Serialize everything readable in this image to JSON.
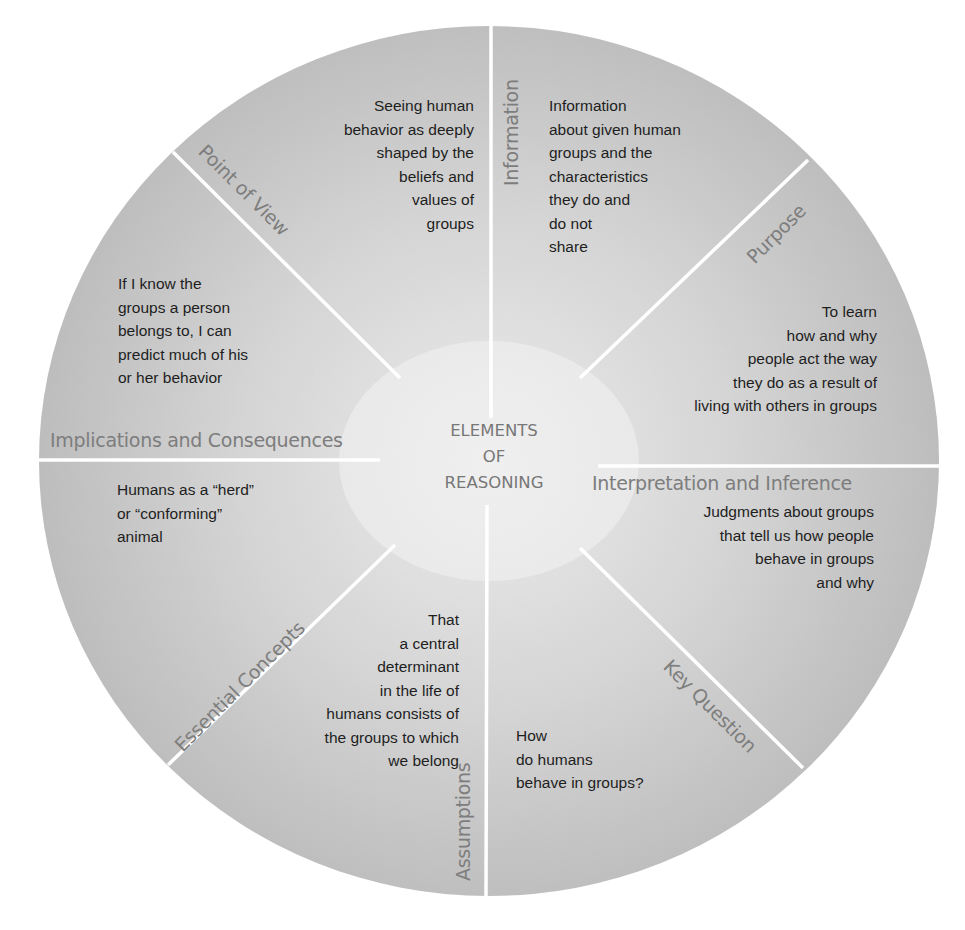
{
  "diagram": {
    "type": "segmented-wheel",
    "center_title": {
      "line1": "ELEMENTS",
      "line2": "OF",
      "line3": "REASONING"
    },
    "colors": {
      "segment_fill": "#c8c8c8",
      "segment_fill_light": "#e2e2e2",
      "divider": "#ffffff",
      "label_text": "#7d7d7d",
      "body_text": "#1e1e1e"
    },
    "segments": [
      {
        "label": "Point of View",
        "text": "Seeing human\nbehavior as deeply\nshaped by the\nbeliefs and\nvalues of\ngroups"
      },
      {
        "label": "Information",
        "text": "Information\nabout given human\ngroups and the\ncharacteristics\nthey do and\ndo not\nshare"
      },
      {
        "label": "Purpose",
        "text": "To learn\nhow and why\npeople act the way\nthey do as a result of\nliving with others in groups"
      },
      {
        "label": "Interpretation and Inference",
        "text": "Judgments about groups\nthat tell us how people\nbehave in groups\nand why"
      },
      {
        "label": "Key Question",
        "text": "How\ndo humans\nbehave in groups?"
      },
      {
        "label": "Assumptions",
        "text": "That\na central\ndeterminant\nin the life of\nhumans consists of\nthe groups to which\nwe belong"
      },
      {
        "label": "Essential Concepts",
        "text": "Humans as a “herd”\nor “conforming”\nanimal"
      },
      {
        "label": "Implications and Consequences",
        "text": "If I know the\ngroups a person\nbelongs to, I can\npredict much of his\nor her behavior"
      }
    ]
  }
}
